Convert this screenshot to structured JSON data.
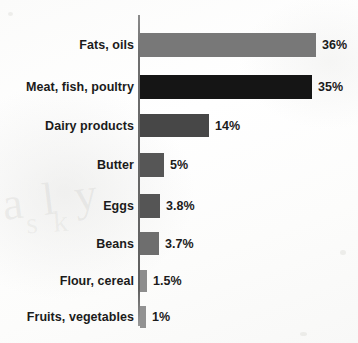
{
  "chart_data": {
    "type": "bar",
    "orientation": "horizontal",
    "title": "",
    "subtitle": "",
    "xlabel": "",
    "ylabel": "",
    "xlim": [
      0,
      36
    ],
    "grid": false,
    "legend": null,
    "axis_line": "vertical category axis at left of bars",
    "units": "percent",
    "categories": [
      "Fats, oils",
      "Meat, fish, poultry",
      "Dairy products",
      "Butter",
      "Eggs",
      "Beans",
      "Flour, cereal",
      "Fruits, vegetables"
    ],
    "values": [
      36,
      35,
      14,
      5,
      3.8,
      3.7,
      1.5,
      1
    ],
    "data_labels": [
      "36%",
      "35%",
      "14%",
      "5%",
      "3.8%",
      "3.7%",
      "1.5%",
      "1%"
    ],
    "bars": [
      {
        "label": "Fats, oils",
        "value": 36,
        "data_label": "36%",
        "color": "#787878",
        "bar_px": 176,
        "row_top": 33,
        "bar_height": 24
      },
      {
        "label": "Meat, fish, poultry",
        "value": 35,
        "data_label": "35%",
        "color": "#151515",
        "bar_px": 172,
        "row_top": 75,
        "bar_height": 24
      },
      {
        "label": "Dairy products",
        "value": 14,
        "data_label": "14%",
        "color": "#474747",
        "bar_px": 69,
        "row_top": 114,
        "bar_height": 23
      },
      {
        "label": "Butter",
        "value": 5,
        "data_label": "5%",
        "color": "#565656",
        "bar_px": 24,
        "row_top": 153,
        "bar_height": 24
      },
      {
        "label": "Eggs",
        "value": 3.8,
        "data_label": "3.8%",
        "color": "#555555",
        "bar_px": 20,
        "row_top": 194,
        "bar_height": 24
      },
      {
        "label": "Beans",
        "value": 3.7,
        "data_label": "3.7%",
        "color": "#6e6e6e",
        "bar_px": 19,
        "row_top": 232,
        "bar_height": 23
      },
      {
        "label": "Flour, cereal",
        "value": 1.5,
        "data_label": "1.5%",
        "color": "#8d8d8d",
        "bar_px": 7,
        "row_top": 270,
        "bar_height": 22
      },
      {
        "label": "Fruits, vegetables",
        "value": 1,
        "data_label": "1%",
        "color": "#929292",
        "bar_px": 6,
        "row_top": 306,
        "bar_height": 22
      }
    ]
  },
  "colors": {
    "axis": "#6f6f6f",
    "text": "#1b1b1b",
    "background": "#fbfbfa"
  },
  "artifacts": {
    "ghost_a": "a l y",
    "ghost_b": "s k"
  }
}
